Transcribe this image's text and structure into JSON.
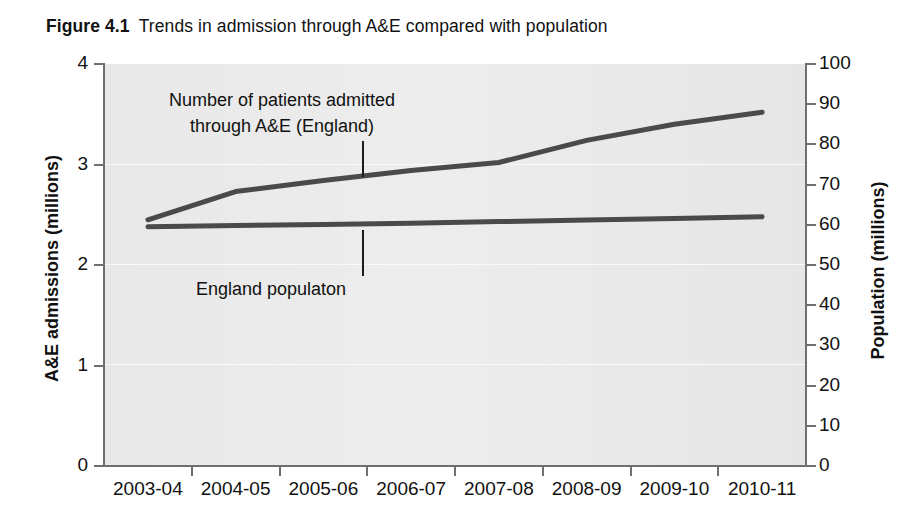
{
  "figure": {
    "label": "Figure 4.1",
    "caption": "Trends in admission through A&E compared with population"
  },
  "chart_data": {
    "type": "line",
    "title": "Trends in admission through A&E compared with population",
    "xlabel": "",
    "ylabel": "A&E admissions (millions)",
    "y2label": "Population (millions)",
    "categories": [
      "2003-04",
      "2004-05",
      "2005-06",
      "2006-07",
      "2007-08",
      "2008-09",
      "2009-10",
      "2010-11"
    ],
    "ylim": [
      0,
      4
    ],
    "y2lim": [
      0,
      100
    ],
    "yticks": [
      "0",
      "1",
      "2",
      "3",
      "4"
    ],
    "y2ticks": [
      "0",
      "10",
      "20",
      "30",
      "40",
      "50",
      "60",
      "70",
      "80",
      "90",
      "100"
    ],
    "grid": true,
    "legend": "annotations-inline",
    "series": [
      {
        "name": "Number of patients admitted through A&E (England)",
        "axis": "left",
        "units": "millions",
        "color": "#4a4a4a",
        "values": [
          2.45,
          2.73,
          2.84,
          2.94,
          3.02,
          3.24,
          3.4,
          3.52
        ]
      },
      {
        "name": "England populaton",
        "axis": "right",
        "units": "millions",
        "color": "#4a4a4a",
        "values": [
          59.5,
          59.8,
          60.1,
          60.4,
          60.8,
          61.2,
          61.6,
          62.0
        ]
      }
    ],
    "annotations": [
      {
        "id": "admissions",
        "text_line1": "Number of patients admitted",
        "text_line2": "through A&E (England)"
      },
      {
        "id": "population",
        "text_line1": "England populaton"
      }
    ]
  }
}
